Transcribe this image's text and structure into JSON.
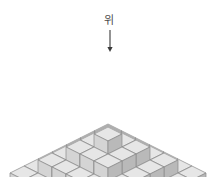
{
  "figure": {
    "title": "",
    "background_color": "#ffffff",
    "annotation": {
      "label": "위",
      "label_x": 109,
      "label_y": 24,
      "arrow": {
        "name": "down-arrow",
        "x": 110,
        "y_start": 30,
        "y_end": 52,
        "color": "#3a3a3a"
      }
    },
    "structure": {
      "type": "stepped-isometric-cube-pyramid",
      "levels": 4,
      "level_widths": [
        7,
        5,
        3,
        1
      ],
      "level_counts": [
        49,
        25,
        9,
        1
      ],
      "total_cubes": 84,
      "origin_x": 108,
      "origin_y": 151,
      "cube_half_width": 14,
      "cube_half_depth": 7,
      "cube_height": 13
    },
    "colors": {
      "top_face": "#e6e6e6",
      "left_face": "#d4d4d4",
      "right_face": "#b9b9b9",
      "edge": "#8a8a8a",
      "arrow": "#3a3a3a",
      "label": "#4a4a4a"
    }
  }
}
